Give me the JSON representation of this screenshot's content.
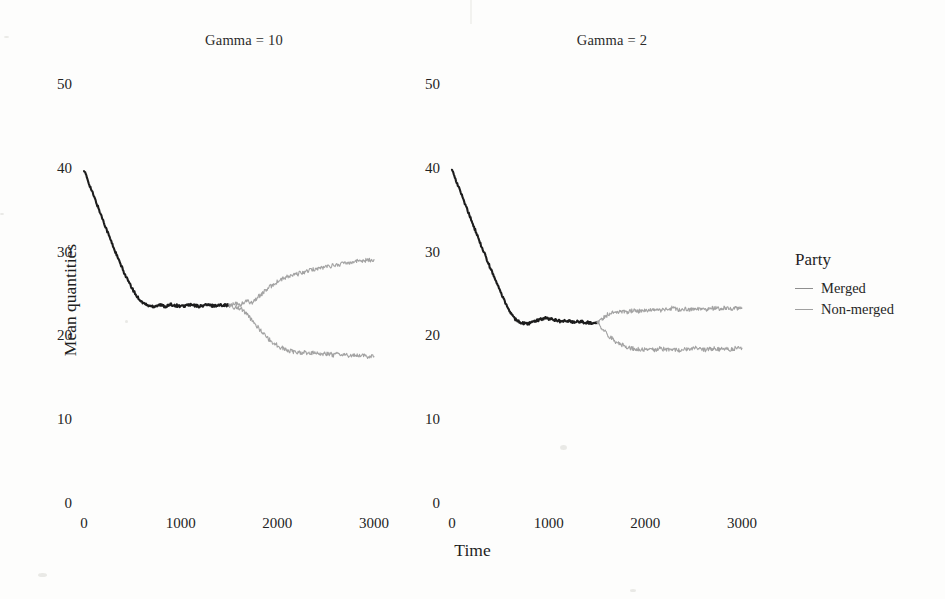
{
  "chart_data": {
    "type": "line",
    "title": "",
    "xlabel": "Time",
    "ylabel": "Mean quantities",
    "xlim": [
      0,
      3000
    ],
    "ylim": [
      0,
      50
    ],
    "xticks": [
      "0",
      "1000",
      "2000",
      "3000"
    ],
    "xtick_values": [
      0,
      1000,
      2000,
      3000
    ],
    "yticks": [
      "0",
      "10",
      "20",
      "30",
      "40",
      "50"
    ],
    "ytick_values": [
      0,
      10,
      20,
      30,
      40,
      50
    ],
    "grid": false,
    "legend": {
      "title": "Party",
      "position": "right",
      "entries": [
        {
          "label": "Merged",
          "color": "#8f8f8f"
        },
        {
          "label": "Non-merged",
          "color": "#a0a0a0"
        }
      ]
    },
    "facets": [
      {
        "title": "Gamma = 10",
        "series": [
          {
            "name": "Merged",
            "color": "#1c1c1c",
            "x": [
              0,
              60,
              120,
              180,
              240,
              300,
              360,
              420,
              480,
              540,
              600,
              660,
              720,
              780,
              840,
              900,
              960,
              1020,
              1080,
              1140,
              1200,
              1260,
              1320,
              1380,
              1440,
              1500
            ],
            "y": [
              40.0,
              38.1,
              36.3,
              34.5,
              32.7,
              30.9,
              29.2,
              27.6,
              26.2,
              25.0,
              24.2,
              23.8,
              23.7,
              23.9,
              23.7,
              23.9,
              23.8,
              23.7,
              23.9,
              23.8,
              23.7,
              23.9,
              23.8,
              23.8,
              23.9,
              23.8
            ]
          },
          {
            "name": "Non-merged-upper",
            "color": "#a3a3a3",
            "x": [
              1500,
              1560,
              1620,
              1680,
              1740,
              1800,
              1860,
              1920,
              1980,
              2040,
              2100,
              2160,
              2220,
              2280,
              2340,
              2400,
              2460,
              2520,
              2580,
              2640,
              2700,
              2760,
              2820,
              2880,
              2940,
              3000
            ],
            "y": [
              23.8,
              24.0,
              23.9,
              24.3,
              24.2,
              24.8,
              25.4,
              26.0,
              26.5,
              26.9,
              27.2,
              27.4,
              27.6,
              27.8,
              28.0,
              28.2,
              28.3,
              28.5,
              28.6,
              28.7,
              28.9,
              29.0,
              29.1,
              29.2,
              29.2,
              29.3
            ]
          },
          {
            "name": "Non-merged-lower",
            "color": "#a3a3a3",
            "x": [
              1500,
              1560,
              1620,
              1680,
              1740,
              1800,
              1860,
              1920,
              1980,
              2040,
              2100,
              2160,
              2220,
              2280,
              2340,
              2400,
              2460,
              2520,
              2580,
              2640,
              2700,
              2760,
              2820,
              2880,
              2940,
              3000
            ],
            "y": [
              23.8,
              23.6,
              23.5,
              22.8,
              22.0,
              21.2,
              20.4,
              19.7,
              19.2,
              18.8,
              18.5,
              18.3,
              18.2,
              18.2,
              18.1,
              18.2,
              18.0,
              18.1,
              17.9,
              18.0,
              17.9,
              17.8,
              17.9,
              17.8,
              17.7,
              17.7
            ]
          }
        ]
      },
      {
        "title": "Gamma = 2",
        "series": [
          {
            "name": "Merged",
            "color": "#1c1c1c",
            "x": [
              0,
              60,
              120,
              180,
              240,
              300,
              360,
              420,
              480,
              540,
              600,
              660,
              720,
              780,
              840,
              900,
              960,
              1020,
              1080,
              1140,
              1200,
              1260,
              1320,
              1380,
              1440,
              1500
            ],
            "y": [
              40.0,
              38.2,
              36.4,
              34.6,
              32.8,
              31.0,
              29.3,
              27.6,
              26.0,
              24.4,
              23.0,
              22.1,
              21.7,
              21.6,
              21.8,
              22.1,
              22.3,
              22.2,
              22.0,
              21.9,
              22.0,
              21.8,
              21.9,
              21.8,
              21.7,
              21.7
            ]
          },
          {
            "name": "Non-merged-upper",
            "color": "#a3a3a3",
            "x": [
              1500,
              1560,
              1620,
              1680,
              1740,
              1800,
              1860,
              1920,
              1980,
              2040,
              2100,
              2160,
              2220,
              2280,
              2340,
              2400,
              2460,
              2520,
              2580,
              2640,
              2700,
              2760,
              2820,
              2880,
              2940,
              3000
            ],
            "y": [
              21.7,
              22.3,
              22.8,
              23.0,
              23.1,
              23.0,
              23.2,
              23.1,
              23.3,
              23.2,
              23.4,
              23.2,
              23.3,
              23.5,
              23.3,
              23.4,
              23.3,
              23.5,
              23.4,
              23.3,
              23.5,
              23.4,
              23.5,
              23.4,
              23.5,
              23.5
            ]
          },
          {
            "name": "Non-merged-lower",
            "color": "#a3a3a3",
            "x": [
              1500,
              1560,
              1620,
              1680,
              1740,
              1800,
              1860,
              1920,
              1980,
              2040,
              2100,
              2160,
              2220,
              2280,
              2340,
              2400,
              2460,
              2520,
              2580,
              2640,
              2700,
              2760,
              2820,
              2880,
              2940,
              3000
            ],
            "y": [
              21.7,
              21.0,
              20.2,
              19.6,
              19.2,
              18.9,
              18.7,
              18.6,
              18.5,
              18.6,
              18.5,
              18.7,
              18.5,
              18.6,
              18.4,
              18.6,
              18.5,
              18.7,
              18.6,
              18.5,
              18.7,
              18.6,
              18.7,
              18.6,
              18.7,
              18.7
            ]
          }
        ]
      }
    ]
  }
}
